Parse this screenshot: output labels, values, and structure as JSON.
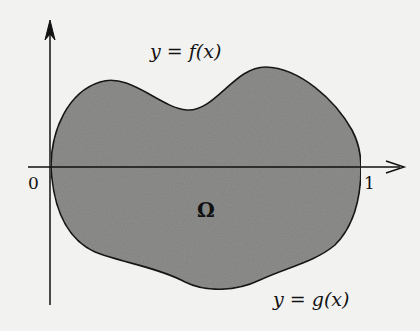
{
  "diagram": {
    "region_label": "Ω",
    "upper_curve_label": "y = f(x)",
    "lower_curve_label": "y = g(x)",
    "x_ticks": [
      "0",
      "1"
    ],
    "colors": {
      "background": "#f2f2f0",
      "region_fill": "#8f8f8f",
      "stroke": "#111111"
    }
  }
}
